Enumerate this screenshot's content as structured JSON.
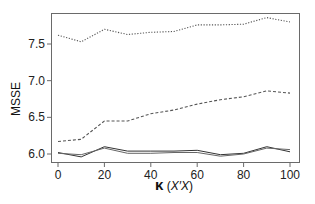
{
  "chart_data": {
    "type": "line",
    "title": "",
    "xlabel": "κ (X′X)",
    "xlabel_parts": {
      "kappa": "κ",
      "open": " (",
      "matrix": "X′X",
      "close": ")"
    },
    "ylabel": "MSSE",
    "xlim": [
      0,
      100
    ],
    "ylim": [
      5.88,
      7.92
    ],
    "x_ticks": [
      0,
      20,
      40,
      60,
      80,
      100
    ],
    "y_ticks": [
      6.0,
      6.5,
      7.0,
      7.5
    ],
    "y_tick_labels": [
      "6.0",
      "6.5",
      "7.0",
      "7.5"
    ],
    "x_tick_labels": [
      "0",
      "20",
      "40",
      "60",
      "80",
      "100"
    ],
    "grid": false,
    "legend": null,
    "x": [
      0,
      10,
      20,
      30,
      40,
      50,
      60,
      70,
      80,
      90,
      100
    ],
    "series": [
      {
        "name": "dotted (top)",
        "style": "dotted",
        "color": "#555555",
        "values": [
          7.62,
          7.53,
          7.7,
          7.63,
          7.66,
          7.67,
          7.76,
          7.76,
          7.77,
          7.86,
          7.8
        ]
      },
      {
        "name": "dashed (middle)",
        "style": "dashed",
        "color": "#555555",
        "values": [
          6.17,
          6.2,
          6.45,
          6.45,
          6.55,
          6.6,
          6.68,
          6.74,
          6.78,
          6.86,
          6.83
        ]
      },
      {
        "name": "solid A",
        "style": "solid",
        "color": "#333333",
        "values": [
          6.02,
          5.96,
          6.1,
          6.04,
          6.04,
          6.04,
          6.05,
          5.99,
          6.01,
          6.1,
          6.03
        ]
      },
      {
        "name": "solid B",
        "style": "solid",
        "color": "#666666",
        "values": [
          6.01,
          5.99,
          6.08,
          6.01,
          6.01,
          6.02,
          6.02,
          5.97,
          6.0,
          6.08,
          6.06
        ]
      }
    ]
  }
}
